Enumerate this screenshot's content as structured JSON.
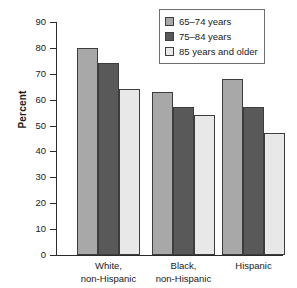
{
  "chart_data": {
    "type": "bar",
    "title": "",
    "xlabel": "",
    "ylabel": "Percent",
    "ylim": [
      0,
      90
    ],
    "yticks": [
      0,
      10,
      20,
      30,
      40,
      50,
      60,
      70,
      80,
      90
    ],
    "grid": false,
    "legend_position": "top-right",
    "categories": [
      "White,\nnon-Hispanic",
      "Black,\nnon-Hispanic",
      "Hispanic"
    ],
    "series": [
      {
        "name": "65–74 years",
        "color": "#a8a8a8",
        "values": [
          80,
          63,
          68
        ]
      },
      {
        "name": "75–84 years",
        "color": "#595959",
        "values": [
          74,
          57,
          57
        ]
      },
      {
        "name": "85 years and older",
        "color": "#e8e8e8",
        "values": [
          64,
          54,
          47
        ]
      }
    ]
  },
  "axis": {
    "tick_labels": [
      "90",
      "80",
      "70",
      "60",
      "50",
      "40",
      "30",
      "20",
      "10",
      "0"
    ]
  },
  "legend": {
    "items": [
      {
        "label": "65–74 years"
      },
      {
        "label": "75–84 years"
      },
      {
        "label": "85 years and older"
      }
    ]
  }
}
